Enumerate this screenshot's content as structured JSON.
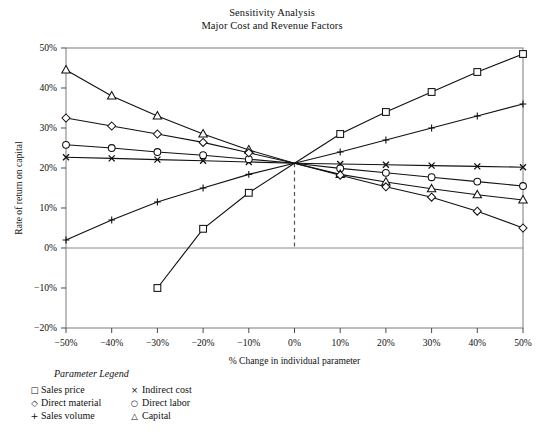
{
  "title": {
    "line1": "Sensitivity Analysis",
    "line2": "Major Cost and Revenue Factors"
  },
  "axes": {
    "ylabel": "Rate of return on capital",
    "xlabel": "% Change in individual parameter",
    "yticks": [
      "50%",
      "40%",
      "30%",
      "20%",
      "10%",
      "0%",
      "-10%",
      "-20%"
    ],
    "xticks": [
      "-50%",
      "-40%",
      "-30%",
      "-20%",
      "-10%",
      "0%",
      "10%",
      "20%",
      "30%",
      "40%",
      "50%"
    ]
  },
  "legend": {
    "title": "Parameter Legend",
    "items": [
      {
        "symbol": "□",
        "label": "Sales price"
      },
      {
        "symbol": "×",
        "label": "Indirect cost"
      },
      {
        "symbol": "◇",
        "label": "Direct material"
      },
      {
        "symbol": "○",
        "label": "Direct labor"
      },
      {
        "symbol": "+",
        "label": "Sales volume"
      },
      {
        "symbol": "△",
        "label": "Capital"
      }
    ]
  },
  "chart_data": {
    "type": "line",
    "xlabel": "% Change in individual parameter",
    "ylabel": "Rate of return on capital",
    "xlim": [
      -50,
      50
    ],
    "ylim": [
      -20,
      50
    ],
    "xtick_values": [
      -50,
      -40,
      -30,
      -20,
      -10,
      0,
      10,
      20,
      30,
      40,
      50
    ],
    "ytick_values": [
      50,
      40,
      30,
      20,
      10,
      0,
      -10,
      -20
    ],
    "grid": false,
    "legend_position": "below-left",
    "annotations": [
      {
        "type": "vertical-dashed-line",
        "x": 0,
        "from_y": 0,
        "to_y": 21.2,
        "note": "base case convergence at x=0%, y=21.2%"
      }
    ],
    "base_case": {
      "x": 0,
      "y": 21.2
    },
    "series": [
      {
        "name": "Sales price",
        "marker": "square",
        "x": [
          -30,
          -20,
          -10,
          0,
          10,
          20,
          30,
          40,
          50
        ],
        "y": [
          -10.0,
          4.8,
          13.8,
          21.2,
          28.5,
          34.0,
          39.0,
          44.0,
          48.5
        ]
      },
      {
        "name": "Sales volume",
        "marker": "plus",
        "x": [
          -50,
          -40,
          -30,
          -20,
          -10,
          0,
          10,
          20,
          30,
          40,
          50
        ],
        "y": [
          2.0,
          7.0,
          11.5,
          15.0,
          18.4,
          21.2,
          24.0,
          27.0,
          30.0,
          33.0,
          36.0
        ]
      },
      {
        "name": "Indirect cost",
        "marker": "x",
        "x": [
          -50,
          -40,
          -30,
          -20,
          -10,
          0,
          10,
          20,
          30,
          40,
          50
        ],
        "y": [
          22.7,
          22.4,
          22.1,
          21.8,
          21.5,
          21.2,
          21.0,
          20.8,
          20.6,
          20.4,
          20.2
        ]
      },
      {
        "name": "Direct labor",
        "marker": "circle",
        "x": [
          -50,
          -40,
          -30,
          -20,
          -10,
          0,
          10,
          20,
          30,
          40,
          50
        ],
        "y": [
          25.8,
          25.0,
          24.0,
          23.2,
          22.2,
          21.2,
          19.9,
          18.8,
          17.7,
          16.6,
          15.5
        ]
      },
      {
        "name": "Capital",
        "marker": "triangle",
        "x": [
          -50,
          -40,
          -30,
          -20,
          -10,
          0,
          10,
          20,
          30,
          40,
          50
        ],
        "y": [
          44.5,
          38.0,
          33.0,
          28.5,
          24.5,
          21.2,
          18.4,
          16.5,
          14.8,
          13.3,
          12.0
        ]
      },
      {
        "name": "Direct material",
        "marker": "diamond",
        "x": [
          -50,
          -40,
          -30,
          -20,
          -10,
          0,
          10,
          20,
          30,
          40,
          50
        ],
        "y": [
          32.5,
          30.5,
          28.5,
          26.4,
          23.8,
          21.2,
          18.2,
          15.3,
          12.7,
          9.2,
          5.0
        ]
      }
    ]
  }
}
